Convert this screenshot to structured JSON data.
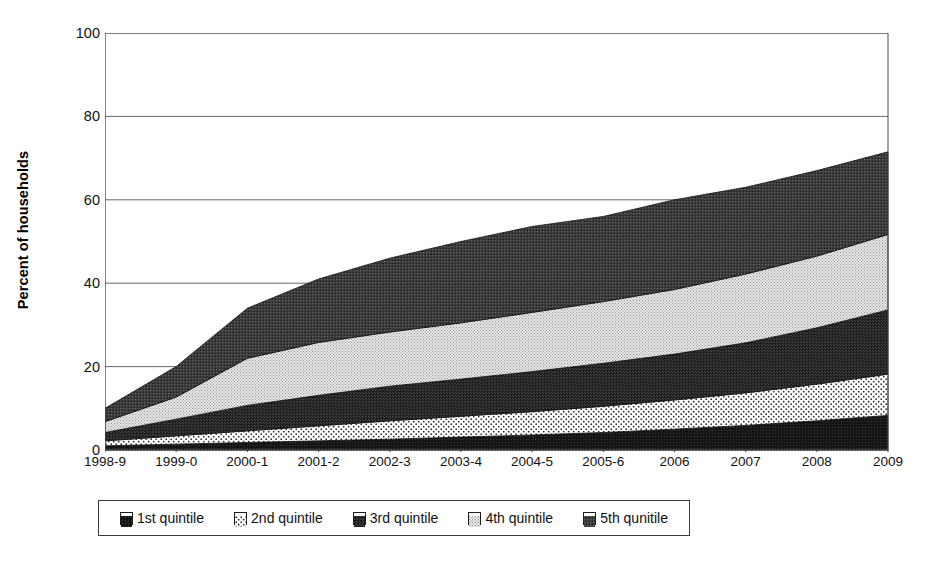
{
  "chart_data": {
    "type": "area",
    "title": "",
    "xlabel": "",
    "ylabel": "Percent of households",
    "ylim": [
      0,
      100
    ],
    "yticks": [
      0,
      20,
      40,
      60,
      80,
      100
    ],
    "grid": true,
    "stacked": true,
    "legend_position": "bottom",
    "categories": [
      "1998-9",
      "1999-0",
      "2000-1",
      "2001-2",
      "2002-3",
      "2003-4",
      "2004-5",
      "2005-6",
      "2006",
      "2007",
      "2008",
      "2009"
    ],
    "series": [
      {
        "name": "1st quintile",
        "fill": "#1c1c1c",
        "pattern": "solid-dark",
        "values": [
          1.0,
          1.4,
          1.8,
          2.2,
          2.6,
          3.1,
          3.6,
          4.2,
          5.0,
          5.9,
          7.0,
          8.3
        ]
      },
      {
        "name": "2nd quintile",
        "fill": "#f2f2f2",
        "pattern": "light-dots",
        "values": [
          1.2,
          2.0,
          2.8,
          3.6,
          4.4,
          5.0,
          5.6,
          6.3,
          7.0,
          7.8,
          8.8,
          9.9
        ]
      },
      {
        "name": "3rd quintile",
        "fill": "#262626",
        "pattern": "dark-check",
        "values": [
          2.0,
          4.0,
          6.1,
          7.3,
          8.3,
          8.9,
          9.6,
          10.3,
          11.0,
          12.0,
          13.5,
          15.4
        ]
      },
      {
        "name": "4th quintile",
        "fill": "#c9c9c9",
        "pattern": "fine-grid",
        "values": [
          2.6,
          5.3,
          11.3,
          12.7,
          13.0,
          13.5,
          14.2,
          14.8,
          15.5,
          16.5,
          17.2,
          18.1
        ]
      },
      {
        "name": "5th qunitile",
        "fill": "#4a4a4a",
        "pattern": "medium-check",
        "values": [
          3.2,
          7.3,
          12.0,
          15.2,
          17.7,
          19.5,
          20.6,
          20.4,
          21.5,
          20.8,
          20.5,
          19.8
        ]
      }
    ],
    "series_totals": [
      10.0,
      20.0,
      34.0,
      41.0,
      46.0,
      50.0,
      53.6,
      56.0,
      60.0,
      63.0,
      67.0,
      71.5
    ]
  },
  "legend": {
    "items": [
      {
        "label": "1st quintile"
      },
      {
        "label": "2nd quintile"
      },
      {
        "label": "3rd quintile"
      },
      {
        "label": "4th quintile"
      },
      {
        "label": "5th qunitile"
      }
    ]
  },
  "axis": {
    "y_title": "Percent of households",
    "y_tick_labels": [
      "100",
      "80",
      "60",
      "40",
      "20",
      "0"
    ],
    "x_tick_labels": [
      "1998-9",
      "1999-0",
      "2000-1",
      "2001-2",
      "2002-3",
      "2003-4",
      "2004-5",
      "2005-6",
      "2006",
      "2007",
      "2008",
      "2009"
    ]
  },
  "colors": {
    "axis": "#4d4d4d",
    "grid": "#555555",
    "series_1": "#1c1c1c",
    "series_2": "#f2f2f2",
    "series_3": "#262626",
    "series_4": "#c9c9c9",
    "series_5": "#4a4a4a"
  }
}
